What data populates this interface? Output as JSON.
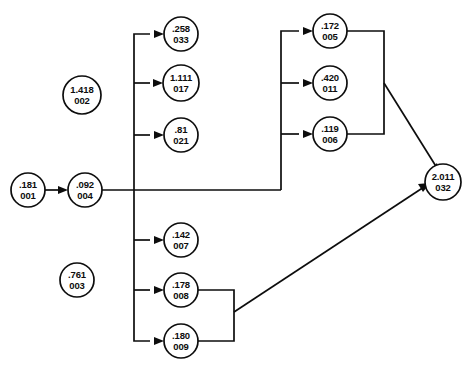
{
  "diagram": {
    "type": "node-link-flow-network",
    "node_shape": "circle",
    "line_color": "#0d0d0d",
    "background_color": "#ffffff",
    "nodes": [
      {
        "id": "n001",
        "value": ".181",
        "code": "001",
        "cx": 28,
        "cy": 190,
        "r": 17
      },
      {
        "id": "n004",
        "value": ".092",
        "code": "004",
        "cx": 85,
        "cy": 190,
        "r": 17
      },
      {
        "id": "n002",
        "value": "1.418",
        "code": "002",
        "cx": 82,
        "cy": 95,
        "r": 19
      },
      {
        "id": "n003",
        "value": ".761",
        "code": "003",
        "cx": 77,
        "cy": 280,
        "r": 17
      },
      {
        "id": "n033",
        "value": ".258",
        "code": "033",
        "cx": 181,
        "cy": 34,
        "r": 17
      },
      {
        "id": "n017",
        "value": "1.111",
        "code": "017",
        "cx": 181,
        "cy": 83,
        "r": 18
      },
      {
        "id": "n021",
        "value": ".81",
        "code": "021",
        "cx": 181,
        "cy": 135,
        "r": 17
      },
      {
        "id": "n007",
        "value": ".142",
        "code": "007",
        "cx": 181,
        "cy": 240,
        "r": 17
      },
      {
        "id": "n008",
        "value": ".178",
        "code": "008",
        "cx": 181,
        "cy": 290,
        "r": 17
      },
      {
        "id": "n009",
        "value": ".180",
        "code": "009",
        "cx": 181,
        "cy": 341,
        "r": 17
      },
      {
        "id": "n005",
        "value": ".172",
        "code": "005",
        "cx": 330,
        "cy": 31,
        "r": 17
      },
      {
        "id": "n011",
        "value": ".420",
        "code": "011",
        "cx": 330,
        "cy": 83,
        "r": 17
      },
      {
        "id": "n006",
        "value": ".119",
        "code": "006",
        "cx": 330,
        "cy": 134,
        "r": 17
      },
      {
        "id": "n032",
        "value": "2.011",
        "code": "032",
        "cx": 443,
        "cy": 182,
        "r": 18
      }
    ],
    "edges": [
      {
        "from": "n001",
        "to": "n004",
        "kind": "direct-arrow"
      },
      {
        "from": "n004",
        "to": "trunk-left",
        "kind": "orthogonal"
      },
      {
        "from": "trunk-left",
        "to": "n033",
        "kind": "orthogonal-arrow"
      },
      {
        "from": "trunk-left",
        "to": "n017",
        "kind": "orthogonal-arrow"
      },
      {
        "from": "trunk-left",
        "to": "n021",
        "kind": "orthogonal-arrow"
      },
      {
        "from": "trunk-left",
        "to": "n007",
        "kind": "orthogonal-arrow"
      },
      {
        "from": "trunk-left",
        "to": "n008",
        "kind": "orthogonal-arrow"
      },
      {
        "from": "trunk-left",
        "to": "n009",
        "kind": "orthogonal-arrow"
      },
      {
        "from": "n004",
        "to": "trunk-right",
        "kind": "orthogonal"
      },
      {
        "from": "trunk-right",
        "to": "n005",
        "kind": "orthogonal-arrow"
      },
      {
        "from": "trunk-right",
        "to": "n011",
        "kind": "orthogonal-arrow"
      },
      {
        "from": "trunk-right",
        "to": "n006",
        "kind": "orthogonal-arrow"
      },
      {
        "from": "n005",
        "to": "n032",
        "kind": "orthogonal-diagonal-arrow"
      },
      {
        "from": "n006",
        "to": "n032",
        "kind": "orthogonal-diagonal-arrow"
      },
      {
        "from": "n008",
        "to": "n032",
        "kind": "orthogonal-diagonal-arrow"
      },
      {
        "from": "n009",
        "to": "n032",
        "kind": "orthogonal-diagonal-arrow"
      }
    ]
  }
}
